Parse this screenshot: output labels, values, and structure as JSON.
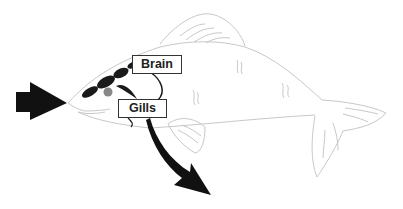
{
  "diagram": {
    "labels": [
      {
        "id": "brain",
        "text": "Brain"
      },
      {
        "id": "gills",
        "text": "Gills"
      }
    ],
    "arrows": [
      {
        "name": "inflow-arrow",
        "description": "water entering mouth"
      },
      {
        "name": "outflow-arrow",
        "description": "water exiting through gills"
      }
    ],
    "colors": {
      "outline": "#c8c8c8",
      "arrow": "#111111",
      "eye": "#888888",
      "brain": "#1a1a1a"
    }
  }
}
